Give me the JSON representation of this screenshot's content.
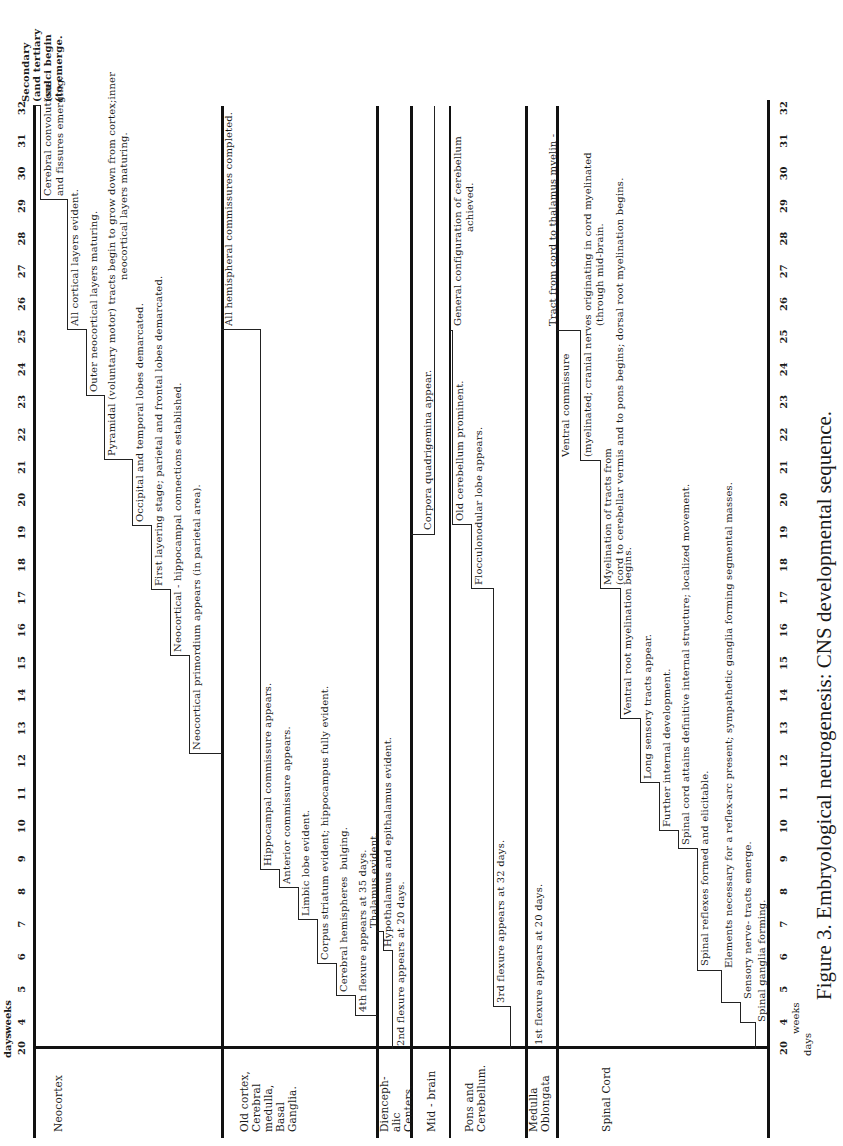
{
  "chart_data": {
    "type": "table",
    "title": "Figure 3. Embryological neurogenesis: CNS developmental sequence.",
    "orientation": "rotated 90 degrees counter-clockwise (time axis runs bottom-to-top)",
    "xlabel": "weeks",
    "x_start_label": "20 days",
    "axis": {
      "units_top": [
        "days",
        "weeks"
      ],
      "units_bottom": [
        "days",
        "weeks"
      ],
      "ticks": [
        "20",
        "4",
        "5",
        "6",
        "7",
        "8",
        "9",
        "10",
        "11",
        "12",
        "13",
        "14",
        "15",
        "16",
        "17",
        "18",
        "19",
        "20",
        "21",
        "22",
        "23",
        "24",
        "25",
        "26",
        "27",
        "28",
        "29",
        "30",
        "31",
        "32"
      ],
      "range_weeks": [
        3,
        32
      ]
    },
    "rows": [
      {
        "name": "Neocortex",
        "events": [
          {
            "week": 11,
            "text": "Neocortical primordium appears (in parietal area)."
          },
          {
            "week": 14,
            "text": "Neocortical - hippocampal connections established."
          },
          {
            "week": 16,
            "text": "First layering stage; parietal and frontal lobes demarcated."
          },
          {
            "week": 18,
            "text": "Occipital and temporal lobes demarcated."
          },
          {
            "week": 20,
            "text": "Pyramidal (voluntary motor) tracts begin to grow down from cortex;inner neocortical layers maturing."
          },
          {
            "week": 22,
            "text": "Outer neocortical layers maturing."
          },
          {
            "week": 24,
            "text": "All cortical layers evident."
          },
          {
            "week": 28,
            "text": "Cerebral convolutions and fissures emerging."
          },
          {
            "week": 32,
            "text": "Secondary (and tertiary (sulci begin (to emerge."
          }
        ]
      },
      {
        "name": "Old cortex, Cerebral medulla, Basal Ganglia.",
        "events": [
          {
            "week": 5,
            "text": "4th flexure appears at 35 days."
          },
          {
            "week": 6,
            "text": "Cerebral hemispheres bulging."
          },
          {
            "week": 7,
            "text": "Corpus striatum evident; hippocampus fully evident."
          },
          {
            "week": 8,
            "text": "Limbic lobe evident."
          },
          {
            "week": 9,
            "text": "Anterior commissure appears."
          },
          {
            "week": 10,
            "text": "Hippocampal commissure appears."
          },
          {
            "week": 24,
            "text": "All hemispheral commissures completed."
          }
        ]
      },
      {
        "name": "Diencephalic Centers.",
        "events": [
          {
            "week": 3,
            "text": "2nd flexure appears at 20 days."
          },
          {
            "week": 6,
            "text": "Hypothalamus and epithalamus evident."
          },
          {
            "week": 7,
            "text": "Thalamus evident."
          }
        ]
      },
      {
        "name": "Mid - brain",
        "events": [
          {
            "week": 16,
            "text": "Corpora quadrigemina appear."
          }
        ]
      },
      {
        "name": "Pons and Cerebellum.",
        "events": [
          {
            "week": 4.5,
            "text": "3rd flexure appears at 32 days."
          },
          {
            "week": 14,
            "text": "Flocculonodular lobe appears."
          },
          {
            "week": 16,
            "text": "Old cerebellum prominent."
          },
          {
            "week": 28,
            "text": "General configuration of cerebellum achieved."
          }
        ]
      },
      {
        "name": "Medulla Oblongata",
        "events": [
          {
            "week": 3,
            "text": "1st flexure appears at 20 days."
          }
        ]
      },
      {
        "name": "Spinal Cord",
        "events": [
          {
            "week": 4,
            "text": "Spinal ganglia forming."
          },
          {
            "week": 5,
            "text": "Sensory nerve- tracts emerge."
          },
          {
            "week": 6,
            "text": "Elements necessary for a reflex-arc present; sympathetic ganglia forming segmental masses."
          },
          {
            "week": 8,
            "text": "Spinal reflexes formed and elicitable."
          },
          {
            "week": 12,
            "text": "Spinal cord attains definitive internal structure; localized movement."
          },
          {
            "week": 13,
            "text": "Further internal development."
          },
          {
            "week": 15,
            "text": "Long sensory tracts appear."
          },
          {
            "week": 16,
            "text": "Ventral root myelination begins."
          },
          {
            "week": 20,
            "text": "Myelination of tracts from (cord to cerebellar vermis and to pons begins; dorsal root myelination begins."
          },
          {
            "week": 24,
            "text": "Ventral commissure (myelinated; cranial nerves originating in cord myelinated (through mid-brain."
          },
          {
            "week": 28,
            "text": "Tract from cord to thalamus myelin - (ated through mid-brain; another tract (from cord to cerebellar vermis (myelinated."
          }
        ]
      }
    ]
  },
  "axis_top": {
    "unit_days": "days",
    "unit_weeks": "weeks"
  },
  "axis_bottom": {
    "unit_days": "days",
    "unit_weeks": "weeks"
  },
  "caption": "Figure 3. Embryological neurogenesis: CNS developmental sequence.",
  "rows": {
    "neocortex": "Neocortex",
    "oldcortex": "Old cortex,\nCerebral\nmedulla,\n  Basal\n  Ganglia.",
    "dienceph": "Dienceph-\nalic\nCenters.",
    "midbrain": "Mid - brain",
    "pons": "Pons and\nCerebellum.",
    "medulla": "Medulla\nOblongata",
    "spinal": "Spinal Cord"
  },
  "events": {
    "neo": [
      "Neocortical primordium appears (in parietal area).",
      "Neocortical - hippocampal connections established.",
      "First layering stage; parietal and frontal lobes demarcated.",
      "Occipital and temporal lobes demarcated.",
      "Pyramidal (voluntary motor) tracts begin to grow down from cortex;inner",
      "neocortical layers maturing.",
      "Outer neocortical layers maturing.",
      "All cortical layers evident.",
      "Cerebral convolutions",
      "and fissures emerging.",
      "Secondary",
      "(and tertiary",
      "(sulci begin",
      "(to emerge."
    ],
    "old": [
      "4th flexure appears at 35 days.",
      "Cerebral hemispheres  bulging.",
      "Corpus striatum evident; hippocampus fully evident.",
      "Limbic lobe evident.",
      "Anterior commissure appears.",
      "Hippocampal commissure appears.",
      "All hemispheral commissures completed."
    ],
    "die": [
      "2nd flexure appears at 20 days.",
      "Hypothalamus and epithalamus evident.",
      "Thalamus evident."
    ],
    "mid": [
      "Corpora quadrigemina appear."
    ],
    "pons": [
      "3rd flexure appears at 32 days.",
      "Flocculonodular lobe appears.",
      "Old cerebellum prominent.",
      "General configuration of cerebellum",
      "achieved."
    ],
    "med": [
      "1st flexure appears at 20 days."
    ],
    "sp": [
      "Spinal ganglia forming.",
      "Sensory nerve- tracts emerge.",
      "Elements necessary for a reflex-arc present; sympathetic ganglia forming segmental masses.",
      "Spinal reflexes formed and elicitable.",
      "Spinal cord attains definitive internal structure; localized movement.",
      "Further internal development.",
      "Long sensory tracts appear.",
      "Ventral root myelination begins.",
      "Myelination of tracts from",
      "(cord to cerebellar vermis and to pons begins; dorsal root myelination begins.",
      "Ventral commissure",
      "(myelinated; cranial nerves originating in cord myelinated",
      "(through mid-brain.",
      "Tract from cord to thalamus myelin -",
      "(ated through mid-brain; another tract",
      "(from cord to cerebellar vermis",
      "(myelinated."
    ]
  },
  "ticks": [
    "20",
    "4",
    "5",
    "6",
    "7",
    "8",
    "9",
    "10",
    "11",
    "12",
    "13",
    "14",
    "15",
    "16",
    "17",
    "18",
    "19",
    "20",
    "21",
    "22",
    "23",
    "24",
    "25",
    "26",
    "27",
    "28",
    "29",
    "30",
    "31",
    "32"
  ]
}
